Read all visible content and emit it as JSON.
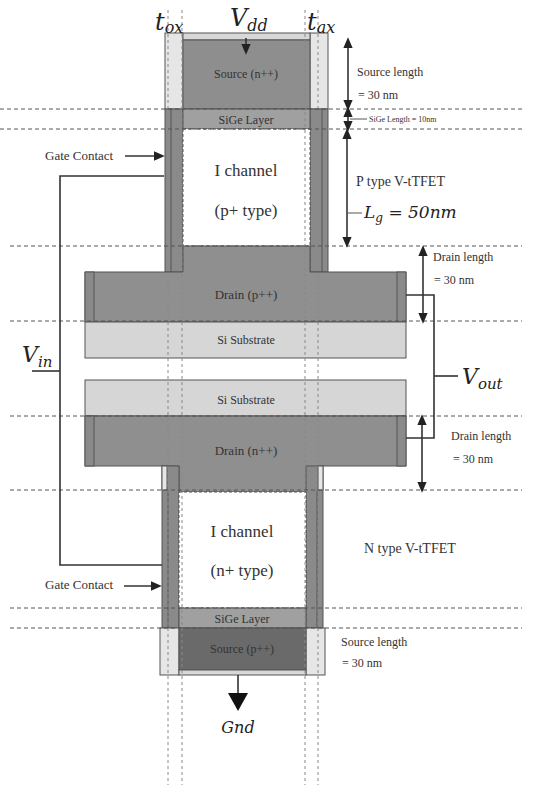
{
  "colors": {
    "oxide": "#e6e6e6",
    "gate": "#8a8a8a",
    "source_n": "#8e8e8e",
    "sige": "#a0a0a0",
    "drain": "#8f8f8f",
    "substrate": "#d6d6d6",
    "channel": "#ffffff",
    "source_p": "#6a6a6a",
    "wire": "#333333"
  },
  "labels": {
    "tox_left": "t",
    "tox_left_sub": "ox",
    "tox_right": "t",
    "tox_right_sub": "ax",
    "vdd": "V",
    "vdd_sub": "dd",
    "vin": "V",
    "vin_sub": "in",
    "vout": "V",
    "vout_sub": "out",
    "gnd": "Gnd"
  },
  "p_device": {
    "name": "P type V-tTFET",
    "source": "Source (n++)",
    "sige": "SiGe Layer",
    "channel_line1": "I channel",
    "channel_line2": "(p+ type)",
    "drain": "Drain (p++)",
    "substrate": "Si Substrate",
    "gate_contact": "Gate Contact",
    "source_length_line1": "Source length",
    "source_length_line2": "= 30 nm",
    "sige_length": "SiGe Length = 10nm",
    "lg": "L",
    "lg_sub": "g",
    "lg_value": " = 50nm",
    "drain_length_line1": "Drain length",
    "drain_length_line2": "= 30 nm"
  },
  "n_device": {
    "name": "N type V-tTFET",
    "substrate": "Si Substrate",
    "drain": "Drain (n++)",
    "channel_line1": "I channel",
    "channel_line2": "(n+ type)",
    "sige": "SiGe Layer",
    "source": "Source (p++)",
    "gate_contact": "Gate Contact",
    "drain_length_line1": "Drain length",
    "drain_length_line2": "= 30 nm",
    "source_length_line1": "Source length",
    "source_length_line2": "= 30 nm"
  }
}
